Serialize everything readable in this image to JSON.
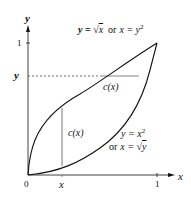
{
  "diagram": {
    "axes": {
      "x_label": "x",
      "y_label": "y",
      "origin_label": "0",
      "x_tick_1": "1",
      "y_tick_1": "1"
    },
    "markers": {
      "x_marker_label": "x",
      "y_marker_label": "y"
    },
    "curves": [
      {
        "name": "upper-curve",
        "equation": "y = √x",
        "alt": "or x = y²"
      },
      {
        "name": "lower-curve",
        "equation": "y = x²",
        "alt": "or x = √y"
      }
    ],
    "labels": {
      "top_curve_label_y": "y = ",
      "top_curve_label_sqrt": "√",
      "top_curve_label_x": "x",
      "top_curve_label_or": "or",
      "top_curve_label_x2": "x = y",
      "top_curve_label_exp": "2",
      "bottom_curve_label_line1": "y = x",
      "bottom_curve_label_exp": "2",
      "bottom_curve_label_or": "or",
      "bottom_curve_label_x": "x = ",
      "bottom_curve_label_sqrt": "√",
      "bottom_curve_label_y": "y",
      "cross_section_horizontal": "c(x)",
      "cross_section_vertical": "c(x)"
    },
    "colors": {
      "stroke": "#111111",
      "dashed": "#333333",
      "background": "#ffffff"
    }
  }
}
